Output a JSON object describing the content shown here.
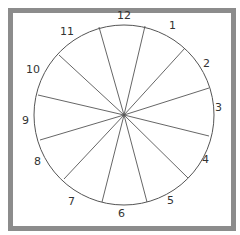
{
  "diagram": {
    "type": "clock-face-sectors",
    "frame_color": "#8c8c8c",
    "line_color": "#555555",
    "circle": {
      "cx": 124,
      "cy": 115,
      "r": 90
    },
    "spokes": [
      {
        "x": 145,
        "y": 26
      },
      {
        "x": 185,
        "y": 48
      },
      {
        "x": 209,
        "y": 88
      },
      {
        "x": 209,
        "y": 136
      },
      {
        "x": 188,
        "y": 178
      },
      {
        "x": 147,
        "y": 202
      },
      {
        "x": 102,
        "y": 202
      },
      {
        "x": 64,
        "y": 179
      },
      {
        "x": 40,
        "y": 140
      },
      {
        "x": 38,
        "y": 95
      },
      {
        "x": 59,
        "y": 55
      },
      {
        "x": 99,
        "y": 27
      }
    ],
    "labels": [
      {
        "text": "12",
        "x": 117,
        "y": 19
      },
      {
        "text": "1",
        "x": 169,
        "y": 29
      },
      {
        "text": "2",
        "x": 203,
        "y": 67
      },
      {
        "text": "3",
        "x": 215,
        "y": 111
      },
      {
        "text": "4",
        "x": 202,
        "y": 163
      },
      {
        "text": "5",
        "x": 167,
        "y": 204
      },
      {
        "text": "6",
        "x": 118,
        "y": 217
      },
      {
        "text": "7",
        "x": 68,
        "y": 205
      },
      {
        "text": "8",
        "x": 34,
        "y": 165
      },
      {
        "text": "9",
        "x": 22,
        "y": 124
      },
      {
        "text": "10",
        "x": 26,
        "y": 73
      },
      {
        "text": "11",
        "x": 60,
        "y": 35
      }
    ]
  }
}
